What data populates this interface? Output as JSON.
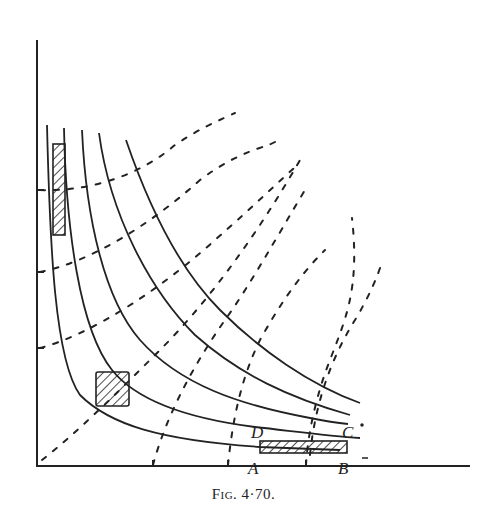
{
  "figure": {
    "caption": "Fig. 4·70.",
    "labels": {
      "A": "A",
      "B": "B",
      "C": "C",
      "D": "D"
    },
    "colors": {
      "ink": "#222222",
      "background": "#ffffff"
    },
    "axes": {
      "x_axis": {
        "from": [
          37,
          466
        ],
        "to": [
          470,
          466
        ]
      },
      "y_axis": {
        "from": [
          37,
          40
        ],
        "to": [
          37,
          466
        ]
      },
      "y_ticks": [
        190,
        272,
        348
      ],
      "x_ticks": [
        153,
        228,
        306
      ]
    },
    "solid_curves": [
      "hyperbola-1 (lowest, passes through A-B bar)",
      "hyperbola-2 (passes through D toward C)",
      "hyperbola-3 (ends at C)",
      "hyperbola-4",
      "hyperbola-5 (outermost)"
    ],
    "dashed_curves_count": 8,
    "hatched_regions": [
      {
        "name": "tall-narrow",
        "x": 53,
        "y": 144,
        "w": 12,
        "h": 91
      },
      {
        "name": "square",
        "x": 96,
        "y": 372,
        "w": 33,
        "h": 34
      },
      {
        "name": "wide-flat",
        "x": 260,
        "y": 441,
        "w": 87,
        "h": 12
      }
    ]
  }
}
